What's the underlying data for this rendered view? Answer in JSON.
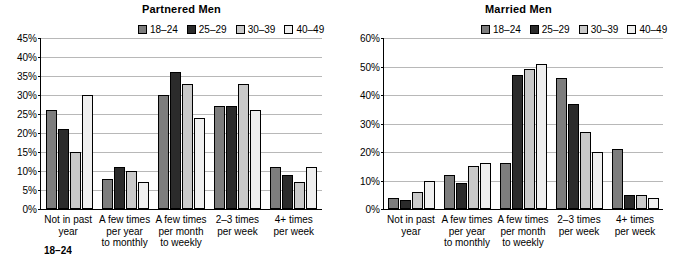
{
  "colors": {
    "series": [
      "#7d7d7d",
      "#2b2b2b",
      "#c9c9c9",
      "#efefef"
    ],
    "grid": "#b8b8b8",
    "axis": "#000000"
  },
  "legend_labels": [
    "18–24",
    "25–29",
    "30–39",
    "40–49"
  ],
  "panels": [
    {
      "title": "Partnered Men",
      "footnote": "18–24",
      "chart_ref": 0
    },
    {
      "title": "Married Men",
      "footnote": "",
      "chart_ref": 1
    }
  ],
  "chart_data": [
    {
      "type": "bar",
      "title": "Partnered Men",
      "xlabel": "",
      "ylabel": "",
      "ylim": [
        0,
        45
      ],
      "yticks": [
        0,
        5,
        10,
        15,
        20,
        25,
        30,
        35,
        40,
        45
      ],
      "ytick_labels": [
        "0%",
        "5%",
        "10%",
        "15%",
        "20%",
        "25%",
        "30%",
        "35%",
        "40%",
        "45%"
      ],
      "grid": true,
      "legend_position": "top-center",
      "categories": [
        "Not in past year",
        "A few times per year to monthly",
        "A few times per month to weekly",
        "2–3 times per week",
        "4+ times per week"
      ],
      "series": [
        {
          "name": "18–24",
          "values": [
            26,
            8,
            30,
            27,
            11
          ]
        },
        {
          "name": "25–29",
          "values": [
            21,
            11,
            36,
            27,
            9
          ]
        },
        {
          "name": "30–39",
          "values": [
            15,
            10,
            33,
            33,
            7
          ]
        },
        {
          "name": "40–49",
          "values": [
            30,
            7,
            24,
            26,
            11
          ]
        }
      ]
    },
    {
      "type": "bar",
      "title": "Married Men",
      "xlabel": "",
      "ylabel": "",
      "ylim": [
        0,
        60
      ],
      "yticks": [
        0,
        10,
        20,
        30,
        40,
        50,
        60
      ],
      "ytick_labels": [
        "0%",
        "10%",
        "20%",
        "30%",
        "40%",
        "50%",
        "60%"
      ],
      "grid": true,
      "legend_position": "top-center",
      "categories": [
        "Not in past year",
        "A few times per year to monthly",
        "A few times per month to weekly",
        "2–3 times per week",
        "4+ times per week"
      ],
      "series": [
        {
          "name": "18–24",
          "values": [
            4,
            12,
            16,
            46,
            21
          ]
        },
        {
          "name": "25–29",
          "values": [
            3,
            9,
            47,
            37,
            5
          ]
        },
        {
          "name": "30–39",
          "values": [
            6,
            15,
            49,
            27,
            5
          ]
        },
        {
          "name": "40–49",
          "values": [
            10,
            16,
            51,
            20,
            4
          ]
        }
      ]
    }
  ]
}
